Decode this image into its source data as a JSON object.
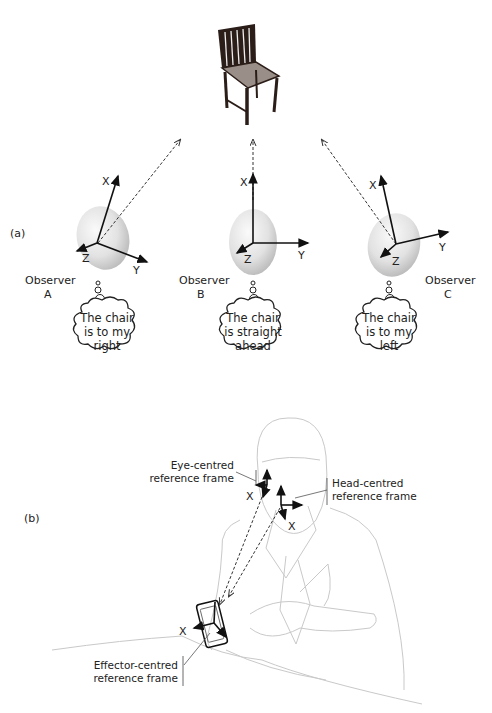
{
  "panel_a": {
    "label": "(a)",
    "observers": [
      {
        "name": "Observer",
        "id": "A",
        "thought": [
          "The chair",
          "is to my",
          "right"
        ]
      },
      {
        "name": "Observer",
        "id": "B",
        "thought": [
          "The chair",
          "is straight",
          "ahead"
        ]
      },
      {
        "name": "Observer",
        "id": "C",
        "thought": [
          "The chair",
          "is to my",
          "left"
        ]
      }
    ],
    "axes": {
      "x": "X",
      "y": "Y",
      "z": "Z"
    }
  },
  "panel_b": {
    "label": "(b)",
    "eye_frame": [
      "Eye-centred",
      "reference frame"
    ],
    "head_frame": [
      "Head-centred",
      "reference frame"
    ],
    "effector_frame": [
      "Effector-centred",
      "reference frame"
    ],
    "axis_x": "X"
  }
}
